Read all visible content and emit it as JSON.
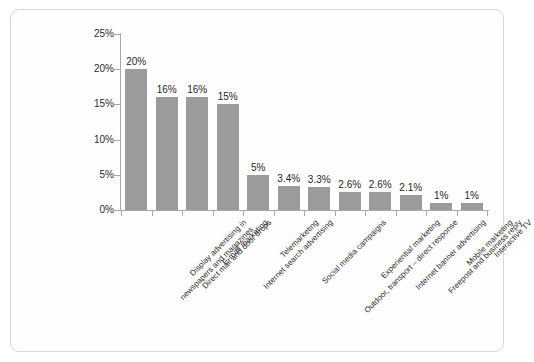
{
  "chart_data": {
    "type": "bar",
    "title": "",
    "subtitle": "",
    "xlabel": "",
    "ylabel": "",
    "ylim": [
      0,
      25
    ],
    "grid": false,
    "legend": false,
    "value_suffix": "%",
    "categories": [
      "Display advertising in newspapers and magazines",
      "Direct mail and door drops",
      "E-mail marketing",
      "Internet search advertising",
      "Telemarketing",
      "Social media campaigns",
      "Outdoor, transport – direct response",
      "Experiential marketing",
      "Internet banner advertising",
      "Freepost and business reply",
      "Mobile marketing",
      "Interactive TV"
    ],
    "category_lines": [
      [
        "Display advertising in",
        "newspapers and magazines"
      ],
      [
        "Direct mail and door drops"
      ],
      [
        "E-mail marketing"
      ],
      [
        "Internet search advertising"
      ],
      [
        "Telemarketing"
      ],
      [
        "Social media campaigns"
      ],
      [
        "Outdoor, transport – direct response"
      ],
      [
        "Experiential marketing"
      ],
      [
        "Internet banner advertising"
      ],
      [
        "Freepost and business reply"
      ],
      [
        "Mobile marketing"
      ],
      [
        "Interactive TV"
      ]
    ],
    "values": [
      20,
      16,
      16,
      15,
      5,
      3.4,
      3.3,
      2.6,
      2.6,
      2.1,
      1,
      1
    ],
    "data_labels": [
      "20%",
      "16%",
      "16%",
      "15%",
      "5%",
      "3.4%",
      "3.3%",
      "2.6%",
      "2.6%",
      "2.1%",
      "1%",
      "1%"
    ],
    "y_ticks": [
      0,
      5,
      10,
      15,
      20,
      25
    ],
    "y_tick_labels": [
      "0%",
      "5%",
      "10%",
      "15%",
      "20%",
      "25%"
    ],
    "colors": {
      "bar": "#9b9b9b",
      "axis": "#a8a8a8",
      "text": "#2b2b2b",
      "frame": "#d8d8d8",
      "background": "#ffffff"
    }
  }
}
